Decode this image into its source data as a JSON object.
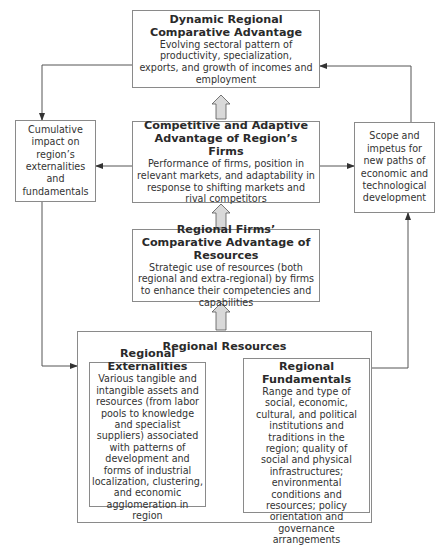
{
  "diagram": {
    "top_box": {
      "title": "Dynamic Regional Comparative Advantage",
      "description": "Evolving sectoral pattern of productivity, specialization, exports, and growth of incomes and employment"
    },
    "middle_box": {
      "title": "Competitive and Adaptive Advantage of Region’s Firms",
      "description": "Performance of firms, position in relevant markets, and adaptability in response to shifting markets and rival competitors"
    },
    "firms_box": {
      "title": "Regional Firms’ Comparative Advantage of Resources",
      "description": "Strategic use of resources (both regional and extra-regional) by firms to enhance their competencies and capabilities"
    },
    "left_box": {
      "text": "Cumulative impact on region’s externalities and fundamentals"
    },
    "right_box": {
      "text": "Scope and impetus for new paths of economic and technological development"
    },
    "resources_box": {
      "title": "Regional Resources",
      "externalities": {
        "title": "Regional Externalities",
        "description": "Various tangible and intangible assets and resources (from labor pools to knowledge and specialist suppliers) associated with patterns of development and forms of industrial localization, clustering, and economic agglomeration in region"
      },
      "fundamentals": {
        "title": "Regional Fundamentals",
        "description": "Range and type of social, economic, cultural, and political institutions and traditions in the region; quality of social and physical infrastructures; environmental conditions and resources; policy orientation and governance arrangements"
      }
    },
    "colors": {
      "border": "#8a8a8a",
      "line": "#555555",
      "block_arrow_fill": "#d9d9d9",
      "text": "#2a2a2a"
    }
  }
}
